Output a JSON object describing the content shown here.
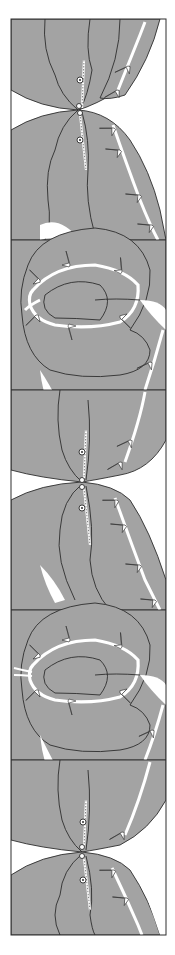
{
  "illustration": {
    "subject": "ornamental vertical border of interlocking gray leaves/pods with thorny white vines",
    "colors": {
      "background": "#ffffff",
      "fill": "#a3a3a3",
      "stroke": "#2e2e2e",
      "vine": "#ffffff"
    },
    "frame": {
      "x": 11,
      "y": 19,
      "width": 155,
      "height": 916
    },
    "motifs": [
      {
        "type": "pod-pair",
        "center_y": 108
      },
      {
        "type": "knot",
        "center_y": 300
      },
      {
        "type": "pod-pair",
        "center_y": 480
      },
      {
        "type": "knot",
        "center_y": 680
      },
      {
        "type": "pod-pair",
        "center_y": 850
      }
    ]
  }
}
